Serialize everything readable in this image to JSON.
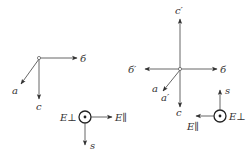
{
  "diagram": {
    "background": "#ffffff",
    "stroke_color": "#555555",
    "text_color": "#333333",
    "left_axes": {
      "labels": {
        "b": "б",
        "a": "a",
        "c": "c"
      }
    },
    "right_axes": {
      "labels": {
        "c_prime": "c′",
        "b_prime": "б′",
        "b": "б",
        "a": "a",
        "a_prime": "a′",
        "c": "c"
      }
    },
    "left_field": {
      "labels": {
        "e_perp": "E⊥",
        "e_par": "E∥",
        "s": "s"
      }
    },
    "right_field": {
      "labels": {
        "s": "s",
        "e_perp": "E⊥",
        "e_par": "E∥"
      }
    }
  }
}
